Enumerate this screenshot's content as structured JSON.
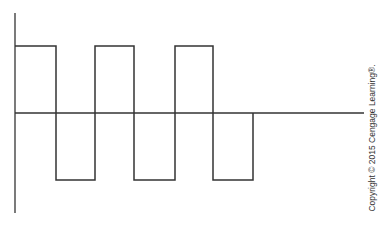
{
  "diagram": {
    "type": "square-wave",
    "stroke_color": "#333333",
    "axes": {
      "vertical": {
        "x": 15,
        "y_top": 13,
        "y_bottom": 213
      },
      "horizontal": {
        "y": 113,
        "x_start": 15,
        "x_end": 364
      }
    },
    "levels": {
      "high_y": 46,
      "zero_y": 113,
      "low_y": 180
    },
    "transitions_x": [
      15,
      56,
      95,
      134,
      175,
      213,
      253
    ],
    "waveform_path": "15,46 56,46 56,180 95,180 95,46 134,46 134,180 175,180 175,46 213,46 213,180 253,180 253,113",
    "cycles": 3
  },
  "credit": {
    "text": "Copyright © 2015 Cengage Learning®."
  }
}
